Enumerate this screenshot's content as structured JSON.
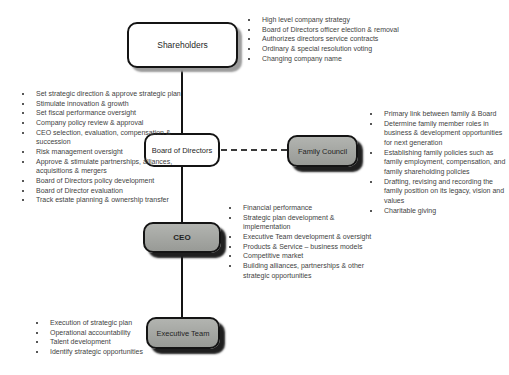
{
  "diagram": {
    "type": "org-chart",
    "nodes": {
      "shareholders": {
        "label": "Shareholders",
        "fill": "#ffffff"
      },
      "board": {
        "label": "Board of Directors",
        "fill": "#ffffff"
      },
      "family_council": {
        "label": "Family Council",
        "fill": "#a0a49e"
      },
      "ceo": {
        "label": "CEO",
        "fill": "#a6a6a6"
      },
      "executive_team": {
        "label": "Executive Team",
        "fill": "#9e9e9e"
      }
    },
    "connectors": {
      "vertical_chain": "Shareholders > Board of Directors > CEO > Executive Team",
      "dashed_link": "Board of Directors -- Family Council"
    },
    "colors": {
      "border": "#141414",
      "line": "#141414",
      "bullet_text": "#3f3f3f",
      "white_box_shadow": "#9b9b9b",
      "gray_box_shadow": "#1f1f1f"
    },
    "bullets": {
      "shareholders": [
        "High level company strategy",
        "Board of Directors officer election & removal",
        "Authorizes directors service contracts",
        "Ordinary & special resolution voting",
        "Changing company name"
      ],
      "board": [
        "Set strategic direction & approve strategic plan",
        "Stimulate innovation & growth",
        "Set fiscal performance oversight",
        "Company policy review & approval",
        "CEO selection, evaluation, compensation & succession",
        "Risk management oversight",
        "Approve & stimulate partnerships, alliances, acquisitions & mergers",
        "Board of Directors policy development",
        "Board of Director evaluation",
        "Track estate planning & ownership transfer"
      ],
      "family_council": [
        "Primary link between family & Board",
        "Determine family member roles in business & development opportunities for next generation",
        "Establishing family policies such as family employment, compensation, and family shareholding policies",
        "Drafting, revising and recording the family position on its legacy, vision and values",
        "Charitable giving"
      ],
      "ceo": [
        "Financial performance",
        "Strategic plan development & implementation",
        "Executive Team development & oversight",
        "Products & Service – business models",
        "Competitive market",
        "Building alliances, partnerships & other strategic opportunities"
      ],
      "executive_team": [
        "Execution of strategic plan",
        "Operational accountability",
        "Talent development",
        "Identify strategic opportunities"
      ]
    }
  }
}
